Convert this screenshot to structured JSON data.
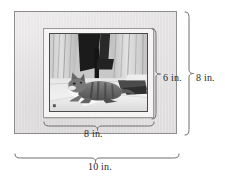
{
  "figure": {
    "kind": "geometry-diagram",
    "photo": {
      "alt_description": "black and white photograph of a tabby cat lying on a light floor in front of draped curtains",
      "is_grayscale": true
    },
    "colors": {
      "frame_fill": "#e6e4e4",
      "frame_border": "#8e8e8e",
      "mat_fill": "#f6f5f3",
      "mat_border": "#9a9a9a",
      "photo_border": "#4a4a4a",
      "brace_stroke": "#6e6e6e",
      "label_text": "#1f1f1f",
      "background": "#ffffff"
    }
  },
  "dimensions": {
    "photo_height": "6 in.",
    "frame_height": "8 in.",
    "photo_width": "8 in.",
    "frame_width": "10 in."
  }
}
